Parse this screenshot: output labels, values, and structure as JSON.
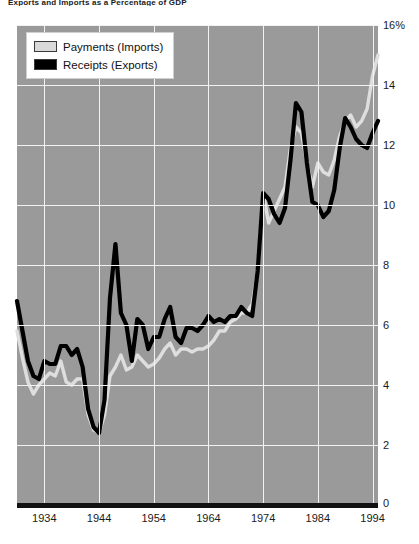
{
  "title": "Exports and Imports as a Percentage of GDP",
  "legend": {
    "position": "top-left",
    "entries": [
      {
        "label": "Payments (Imports)",
        "color": "#d9d9d9"
      },
      {
        "label": "Receipts (Exports)",
        "color": "#000000"
      }
    ]
  },
  "axis": {
    "y_ticks": [
      "16%",
      "14",
      "12",
      "10",
      "8",
      "6",
      "4",
      "2"
    ],
    "x_ticks": [
      "1934",
      "1944",
      "1954",
      "1964",
      "1974",
      "1984",
      "1994"
    ],
    "zero_label": "0"
  },
  "colors": {
    "plot_background": "#9a9a9a",
    "gridline": "#f2f2f2",
    "imports_line": "#dedede",
    "exports_line": "#000000",
    "baseline": "#111111",
    "text": "#1a1a1a"
  },
  "chart_data": {
    "type": "line",
    "title": "Exports and Imports as a Percentage of GDP",
    "xlabel": "",
    "ylabel": "Percent of GDP",
    "xlim": [
      1929,
      1995
    ],
    "ylim": [
      0,
      16
    ],
    "grid": true,
    "legend_position": "top-left",
    "x": [
      1929,
      1930,
      1931,
      1932,
      1933,
      1934,
      1935,
      1936,
      1937,
      1938,
      1939,
      1940,
      1941,
      1942,
      1943,
      1944,
      1945,
      1946,
      1947,
      1948,
      1949,
      1950,
      1951,
      1952,
      1953,
      1954,
      1955,
      1956,
      1957,
      1958,
      1959,
      1960,
      1961,
      1962,
      1963,
      1964,
      1965,
      1966,
      1967,
      1968,
      1969,
      1970,
      1971,
      1972,
      1973,
      1974,
      1975,
      1976,
      1977,
      1978,
      1979,
      1980,
      1981,
      1982,
      1983,
      1984,
      1985,
      1986,
      1987,
      1988,
      1989,
      1990,
      1991,
      1992,
      1993,
      1994,
      1995
    ],
    "series": [
      {
        "name": "Receipts (Exports)",
        "color": "#000000",
        "values": [
          6.8,
          5.8,
          4.8,
          4.3,
          4.2,
          4.8,
          4.7,
          4.7,
          5.3,
          5.3,
          5.0,
          5.2,
          4.6,
          3.2,
          2.6,
          2.4,
          3.5,
          6.9,
          8.7,
          6.4,
          6.0,
          4.8,
          6.2,
          6.0,
          5.2,
          5.6,
          5.6,
          6.2,
          6.6,
          5.6,
          5.4,
          5.9,
          5.9,
          5.8,
          6.0,
          6.3,
          6.1,
          6.2,
          6.1,
          6.3,
          6.3,
          6.6,
          6.4,
          6.3,
          7.8,
          10.4,
          10.2,
          9.7,
          9.4,
          9.9,
          11.5,
          13.4,
          13.1,
          11.4,
          10.1,
          10.0,
          9.6,
          9.8,
          10.5,
          11.9,
          12.9,
          12.6,
          12.2,
          12.0,
          11.9,
          12.4,
          12.8
        ]
      },
      {
        "name": "Payments (Imports)",
        "color": "#dedede",
        "values": [
          5.8,
          4.9,
          4.1,
          3.7,
          4.0,
          4.2,
          4.4,
          4.3,
          4.8,
          4.1,
          4.0,
          4.2,
          4.2,
          3.0,
          2.5,
          2.4,
          3.0,
          4.3,
          4.6,
          5.0,
          4.5,
          4.6,
          5.0,
          4.8,
          4.6,
          4.7,
          4.9,
          5.2,
          5.4,
          5.0,
          5.2,
          5.2,
          5.1,
          5.2,
          5.2,
          5.3,
          5.5,
          5.8,
          5.8,
          6.1,
          6.2,
          6.4,
          6.4,
          6.7,
          7.8,
          10.4,
          9.4,
          9.8,
          10.2,
          10.6,
          11.9,
          12.6,
          12.4,
          11.4,
          10.6,
          11.4,
          11.1,
          11.0,
          11.5,
          12.3,
          12.8,
          13.0,
          12.6,
          12.8,
          13.2,
          14.3,
          15.0
        ]
      }
    ]
  }
}
